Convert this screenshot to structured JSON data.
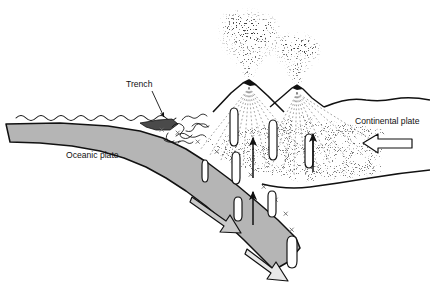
{
  "figure": {
    "type": "geological-cross-section"
  },
  "labels": {
    "trench": "Trench",
    "oceanic_plate": "Oceanic plate",
    "continental_plate": "Continental plate"
  },
  "colors": {
    "slab_fill": "#b5b5b5",
    "ink": "#111111",
    "background": "#ffffff",
    "wedge_fill": "#4a4a4a",
    "magma_fill": "#ffffff"
  },
  "features": {
    "sea_surface": "wavy-water-line",
    "slab_marks": "x-marks",
    "magma_blobs": 8,
    "volcanoes": 2,
    "ash_plumes": 2,
    "motion_arrows": {
      "continental_plate": "left",
      "slab_upper": "down-right",
      "slab_lower": "down-right",
      "magma_rise": "up"
    }
  }
}
